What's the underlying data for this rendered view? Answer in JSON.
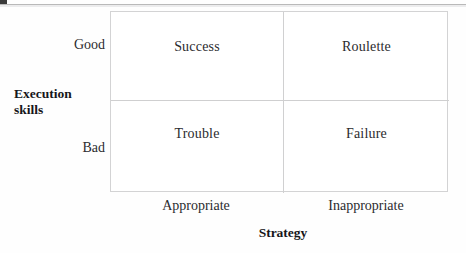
{
  "figure": {
    "type": "2x2-matrix",
    "y_axis": {
      "title_line1": "Execution",
      "title_line2": "skills",
      "ticks": [
        "Good",
        "Bad"
      ]
    },
    "x_axis": {
      "title": "Strategy",
      "ticks": [
        "Appropriate",
        "Inappropriate"
      ]
    },
    "quadrants": [
      {
        "label": "Success",
        "x": "Appropriate",
        "y": "Good"
      },
      {
        "label": "Roulette",
        "x": "Inappropriate",
        "y": "Good"
      },
      {
        "label": "Trouble",
        "x": "Appropriate",
        "y": "Bad"
      },
      {
        "label": "Failure",
        "x": "Inappropriate",
        "y": "Bad"
      }
    ],
    "colors": {
      "background": "#ffffff",
      "border": "#d3d3d4",
      "divider": "#d0d0d1",
      "text": "#2b2b2e",
      "title_text": "#16161a"
    }
  }
}
